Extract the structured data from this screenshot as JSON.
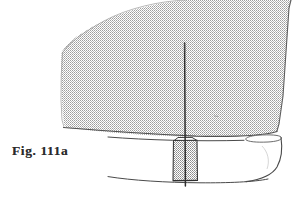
{
  "figure": {
    "caption": "Fig. 111a",
    "alt_description": "Line drawing of a sailboat viewed from astern showing a large shaded mainsail, mast, hull and keel",
    "background_color": "#ffffff",
    "ink_color": "#3a3a3a",
    "sail_fill_color": "#c9c9c9",
    "sail_halftone_dot_color": "#a8a8a8",
    "keel_fill_color": "#b5b5b5",
    "caption_color": "#2b2b2b"
  },
  "parts": {
    "sail": {
      "label": "mainsail",
      "fill": "#c9c9c9",
      "outline": "#6e6e6e",
      "path": "M 186,0 L 290,0 L 289,6 L 285,60 L 281,112 L 277,131 L 268,134 L 240,136 L 200,137 L 150,136 L 110,133 L 78,130 L 64,128 L 63,120 L 62,100 L 61,70 L 61,52 L 64,47 L 78,36 L 96,25 L 118,15 L 145,7 L 168,2 Z"
    },
    "mast": {
      "label": "mast",
      "color": "#2f2f2f",
      "x": 184.5,
      "y_top": 43,
      "y_bottom": 186
    },
    "boom_line": {
      "label": "boom-foot-line",
      "color": "#5a5a5a"
    },
    "hull": {
      "label": "hull",
      "outline": "#4a4a4a",
      "deck_left_x": 108,
      "deck_right_x": 279,
      "keel_bottom_y": 180
    },
    "deck_edge": {
      "label": "deck-edge-ellipse",
      "outline": "#5a5a5a"
    },
    "keel": {
      "label": "keel",
      "fill": "#b5b5b5",
      "outline": "#3d3d3d",
      "x_left": 172,
      "x_right": 198,
      "y_top": 137,
      "y_bottom": 180
    },
    "waterline": {
      "label": "hull-bottom-curve",
      "color": "#4a4a4a"
    }
  }
}
